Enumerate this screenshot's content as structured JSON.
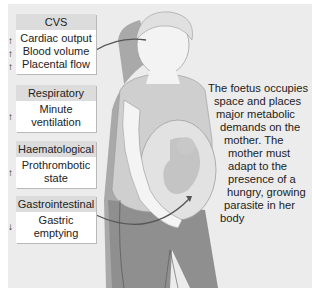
{
  "systems": [
    {
      "header": "CVS",
      "lines": [
        "Cardiac output",
        "Blood volume",
        "Placental flow"
      ],
      "arrows": [
        "up",
        "up",
        "up"
      ]
    },
    {
      "header": "Respiratory",
      "lines": [
        "Minute",
        "ventilation"
      ],
      "arrows": [
        "up"
      ]
    },
    {
      "header": "Haematological",
      "lines": [
        "Prothrombotic",
        "state"
      ],
      "arrows": [
        "up"
      ]
    },
    {
      "header": "Gastrointestinal",
      "lines": [
        "Gastric",
        "emptying"
      ],
      "arrows": [
        "down"
      ]
    }
  ],
  "arrow_glyphs": {
    "up": "↑",
    "down": "↓"
  },
  "description_lines": [
    "The foetus occupies",
    "space and places",
    "major metabolic",
    "demands on the",
    "mother. The",
    "mother must",
    "adapt to the",
    "presence of a",
    "hungry, growing",
    "parasite in her",
    "body"
  ],
  "colors": {
    "panel": "#ececec",
    "header": "#dcdcdc",
    "body_fill": "#ffffff",
    "figure_dark": "#8f8f8f",
    "figure_light": "#d9d9d9",
    "connector": "#555555"
  }
}
